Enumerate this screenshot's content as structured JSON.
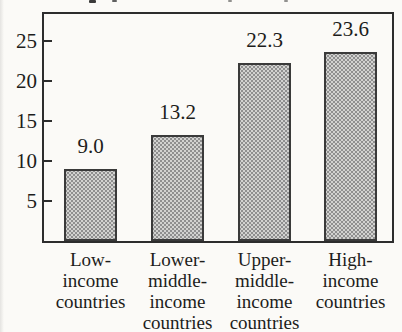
{
  "chart_data": {
    "type": "bar",
    "categories": [
      "Low-income countries",
      "Lower-middle-income countries",
      "Upper-middle-income countries",
      "High-income countries"
    ],
    "category_label_lines": [
      [
        "Low-",
        "income",
        "countries"
      ],
      [
        "Lower-",
        "middle-",
        "income",
        "countries"
      ],
      [
        "Upper-",
        "middle-",
        "income",
        "countries"
      ],
      [
        "High-",
        "income",
        "countries"
      ]
    ],
    "values": [
      9.0,
      13.2,
      22.3,
      23.6
    ],
    "value_labels": [
      "9.0",
      "13.2",
      "22.3",
      "23.6"
    ],
    "y_ticks": [
      5,
      10,
      15,
      20,
      25
    ],
    "y_tick_labels": [
      "5",
      "10",
      "15",
      "20",
      "25"
    ],
    "ylim": [
      0,
      28.6
    ],
    "xlabel": "",
    "ylabel": "",
    "grid": false,
    "legend": false,
    "bar_texture": "halftone-stipple",
    "colors": {
      "background": "#fbfaf7",
      "frame": "#2d2d2d",
      "text": "#1d1d1b",
      "bar_fill": "#d2d2d0",
      "bar_dot": "#8f8f8f",
      "bar_border": "#3a3a3a"
    }
  }
}
